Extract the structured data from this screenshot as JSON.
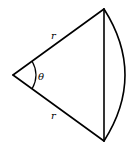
{
  "diagram": {
    "type": "circular-sector",
    "stroke_color": "#000000",
    "background": "#ffffff",
    "labels": {
      "radius_top": "r",
      "radius_bottom": "r",
      "angle": "θ"
    },
    "points": {
      "center": [
        13,
        75
      ],
      "top_vertex": [
        104,
        9
      ],
      "bottom_vertex": [
        104,
        141
      ]
    }
  }
}
